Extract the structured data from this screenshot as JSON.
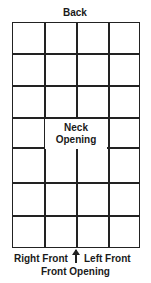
{
  "diagram": {
    "top_label": "Back",
    "center_label_line1": "Neck",
    "center_label_line2": "Opening",
    "bottom_left_label": "Right Front",
    "bottom_right_label": "Left Front",
    "bottom_label": "Front Opening",
    "grid": {
      "columns": 4,
      "rows": 7,
      "merged_cell": {
        "row": 4,
        "cols": [
          2,
          3
        ]
      }
    },
    "line_color": "#222222"
  }
}
